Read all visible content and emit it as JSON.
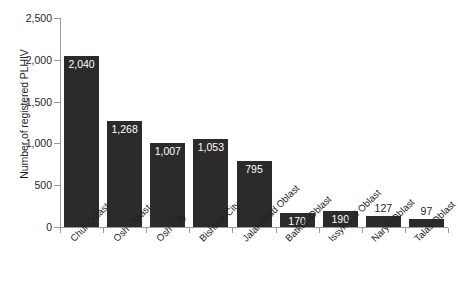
{
  "chart_data": {
    "type": "bar",
    "title": "",
    "xlabel": "",
    "ylabel": "Number of registered PLHIV",
    "ylim": [
      0,
      2500
    ],
    "ytick_labels": [
      "0",
      "500",
      "1,000",
      "1,500",
      "2,000",
      "2,500"
    ],
    "ytick_values": [
      0,
      500,
      1000,
      1500,
      2000,
      2500
    ],
    "grid": false,
    "legend": "none",
    "bar_color": "#2b2b2b",
    "axis_color": "#9a9a9a",
    "background": "#ffffff",
    "categories": [
      "Chui Oblast",
      "Osh Oblast",
      "Osh City",
      "Bishkek City",
      "Jalal-Abad Oblast",
      "Batken Oblast",
      "Issyk-Kul Oblast",
      "Naryn Oblast",
      "Talas Oblast"
    ],
    "values": [
      2040,
      1268,
      1007,
      1053,
      795,
      170,
      190,
      127,
      97
    ],
    "value_labels": [
      "2,040",
      "1,268",
      "1,007",
      "1,053",
      "795",
      "170",
      "190",
      "127",
      "97"
    ],
    "label_placement": [
      "inside",
      "inside",
      "inside",
      "inside",
      "inside",
      "inside",
      "inside",
      "outside",
      "outside"
    ]
  }
}
